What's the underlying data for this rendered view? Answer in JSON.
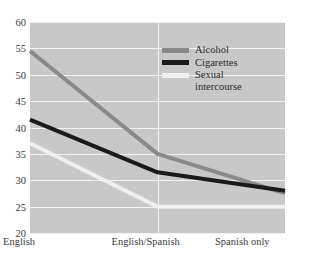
{
  "chart_data": {
    "type": "line",
    "title": "",
    "xlabel": "",
    "ylabel": "",
    "categories": [
      "English",
      "English/Spanish",
      "Spanish only"
    ],
    "yticks": [
      20,
      25,
      30,
      35,
      40,
      45,
      50,
      55,
      60
    ],
    "ylim": [
      20,
      60
    ],
    "grid": true,
    "legend_position": "upper-center-right",
    "plot_background": "#c8c8c8",
    "gridline_color": "#f2f2f2",
    "series": [
      {
        "name": "Alcohol",
        "values": [
          54.5,
          35.0,
          27.5
        ],
        "color": "#8a8a8a"
      },
      {
        "name": "Cigarettes",
        "values": [
          41.5,
          31.5,
          28.0
        ],
        "color": "#1a1a1a"
      },
      {
        "name": "Sexual\nintercourse",
        "values": [
          37.0,
          25.0,
          25.0
        ],
        "color": "#f0f0f0"
      }
    ]
  },
  "legend": {
    "items": [
      {
        "label": "Alcohol"
      },
      {
        "label": "Cigarettes"
      },
      {
        "label": "Sexual\nintercourse"
      }
    ]
  }
}
